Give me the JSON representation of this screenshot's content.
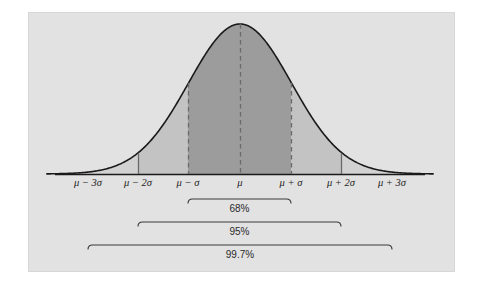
{
  "figure": {
    "panel": {
      "background_color": "#e2e2e2",
      "page_background_color": "#ffffff",
      "x": 28,
      "y": 12,
      "width": 427,
      "height": 260
    },
    "curve": {
      "stroke_color": "#1a1a1a",
      "peak_x": 240,
      "peak_y": 24,
      "baseline_y": 174
    },
    "fills": {
      "inner_68_color": "#9c9c9c",
      "middle_95_color": "#c3c3c3",
      "outer_tail_color": "#d2d2d2"
    },
    "guides": {
      "dashed_color": "#6a6a6a",
      "axis_color": "#1a1a1a"
    }
  },
  "axis": {
    "label": "",
    "ticks": [
      {
        "name": "minus-3-sigma",
        "label": "μ − 3σ",
        "x": 88,
        "sigma": -3,
        "marker": "none"
      },
      {
        "name": "minus-2-sigma",
        "label": "μ − 2σ",
        "x": 138,
        "sigma": -2,
        "marker": "tick"
      },
      {
        "name": "minus-1-sigma",
        "label": "μ − σ",
        "x": 188,
        "sigma": -1,
        "marker": "dashed"
      },
      {
        "name": "mu",
        "label": "μ",
        "x": 240,
        "sigma": 0,
        "marker": "dashed"
      },
      {
        "name": "plus-1-sigma",
        "label": "μ + σ",
        "x": 291,
        "sigma": 1,
        "marker": "dashed"
      },
      {
        "name": "plus-2-sigma",
        "label": "μ + 2σ",
        "x": 341,
        "sigma": 2,
        "marker": "tick"
      },
      {
        "name": "plus-3-sigma",
        "label": "μ + 3σ",
        "x": 392,
        "sigma": 3,
        "marker": "none"
      }
    ],
    "tick_label_y": 186
  },
  "brackets": [
    {
      "name": "bracket-68",
      "label": "68%",
      "from_sigma": -1,
      "to_sigma": 1,
      "x1": 188,
      "x2": 291,
      "line_y": 199,
      "label_y": 212
    },
    {
      "name": "bracket-95",
      "label": "95%",
      "from_sigma": -2,
      "to_sigma": 2,
      "x1": 138,
      "x2": 341,
      "line_y": 222,
      "label_y": 235
    },
    {
      "name": "bracket-997",
      "label": "99.7%",
      "from_sigma": -3,
      "to_sigma": 3,
      "x1": 88,
      "x2": 392,
      "line_y": 245,
      "label_y": 258
    }
  ],
  "chart_data": {
    "type": "area",
    "title": "",
    "subtitle": "",
    "xlabel": "",
    "ylabel": "",
    "distribution": "normal",
    "mean_label": "μ",
    "sd_label": "σ",
    "xlim": [
      -3.75,
      3.75
    ],
    "ylim": [
      0,
      1
    ],
    "grid": false,
    "legend": "none",
    "x_tick_values": [
      -3,
      -2,
      -1,
      0,
      1,
      2,
      3
    ],
    "x_tick_labels": [
      "μ − 3σ",
      "μ − 2σ",
      "μ − σ",
      "μ",
      "μ + σ",
      "μ + 2σ",
      "μ + 3σ"
    ],
    "series": [
      {
        "name": "Standard normal density",
        "x": [
          -3.75,
          -3.5,
          -3.25,
          -3,
          -2.75,
          -2.5,
          -2.25,
          -2,
          -1.75,
          -1.5,
          -1.25,
          -1,
          -0.75,
          -0.5,
          -0.25,
          0,
          0.25,
          0.5,
          0.75,
          1,
          1.25,
          1.5,
          1.75,
          2,
          2.25,
          2.5,
          2.75,
          3,
          3.25,
          3.5,
          3.75
        ],
        "values": [
          0.0009,
          0.0022,
          0.0051,
          0.0111,
          0.0228,
          0.0439,
          0.0796,
          0.1353,
          0.2163,
          0.3247,
          0.4578,
          0.6065,
          0.7548,
          0.8825,
          0.9692,
          1.0,
          0.9692,
          0.8825,
          0.7548,
          0.6065,
          0.4578,
          0.3247,
          0.2163,
          0.1353,
          0.0796,
          0.0439,
          0.0228,
          0.0111,
          0.0051,
          0.0022,
          0.0009
        ]
      }
    ],
    "shaded_regions": [
      {
        "name": "within-1-sd",
        "from": -1,
        "to": 1,
        "area_percent": 68,
        "label": "68%",
        "color": "#9c9c9c"
      },
      {
        "name": "within-2-sd",
        "from": -2,
        "to": 2,
        "area_percent": 95,
        "label": "95%",
        "color": "#c3c3c3"
      },
      {
        "name": "within-3-sd",
        "from": -3,
        "to": 3,
        "area_percent": 99.7,
        "label": "99.7%",
        "color": "#d2d2d2"
      }
    ],
    "annotations": [
      "68%",
      "95%",
      "99.7%"
    ]
  }
}
